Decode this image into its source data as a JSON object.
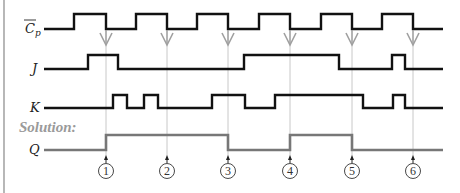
{
  "diagram": {
    "type": "jk-flip-flop-timing",
    "signals": [
      {
        "id": "cp",
        "label": "C",
        "label_sub": "p",
        "label_overbar": true,
        "y_low": 29,
        "y_high": 14,
        "high_intervals": [
          [
            74,
            106
          ],
          [
            136,
            167
          ],
          [
            197,
            228
          ],
          [
            259,
            290
          ],
          [
            321,
            352
          ],
          [
            382,
            413
          ]
        ]
      },
      {
        "id": "j",
        "label": "J",
        "y_low": 69,
        "y_high": 55,
        "high_intervals": [
          [
            88,
            118
          ],
          [
            244,
            339
          ],
          [
            392,
            405
          ]
        ]
      },
      {
        "id": "k",
        "label": "K",
        "y_low": 108,
        "y_high": 95,
        "high_intervals": [
          [
            113,
            127
          ],
          [
            144,
            158
          ],
          [
            212,
            245
          ],
          [
            275,
            363
          ],
          [
            393,
            405
          ]
        ]
      },
      {
        "id": "q",
        "label": "Q",
        "y_low": 150,
        "y_high": 135,
        "high_intervals": [
          [
            106,
            228
          ],
          [
            290,
            352
          ]
        ]
      }
    ],
    "x_start": 44,
    "x_end": 443,
    "solution_label": "Solution:",
    "clock_edges": [
      {
        "x": 106,
        "number": "1"
      },
      {
        "x": 167,
        "number": "2"
      },
      {
        "x": 228,
        "number": "3"
      },
      {
        "x": 290,
        "number": "4"
      },
      {
        "x": 352,
        "number": "5"
      },
      {
        "x": 413,
        "number": "6"
      }
    ],
    "colors": {
      "signal": "#111111",
      "solution_signal": "#777777",
      "solution_text": "#9a9a9a",
      "guide_line": "#c8c8c8",
      "arrow": "#a0a0a0",
      "border": "#888888"
    }
  }
}
